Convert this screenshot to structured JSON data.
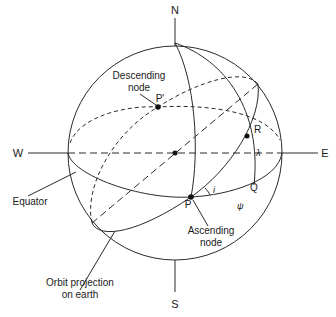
{
  "diagram": {
    "type": "celestial-sphere-orbit",
    "compass": {
      "north": "N",
      "south": "S",
      "west": "W",
      "east": "E"
    },
    "points": {
      "ascending": "P",
      "descending": "P'",
      "r": "R",
      "q": "Q"
    },
    "symbols": {
      "inclination": "i",
      "lambda": "λ",
      "psi": "ψ"
    },
    "labels": {
      "descending_node_1": "Descending",
      "descending_node_2": "node",
      "ascending_node_1": "Ascending",
      "ascending_node_2": "node",
      "equator": "Equator",
      "orbit_1": "Orbit projection",
      "orbit_2": "on earth"
    },
    "colors": {
      "line": "#2a2a2a",
      "text": "#1a1a1a",
      "background": "#ffffff"
    }
  }
}
